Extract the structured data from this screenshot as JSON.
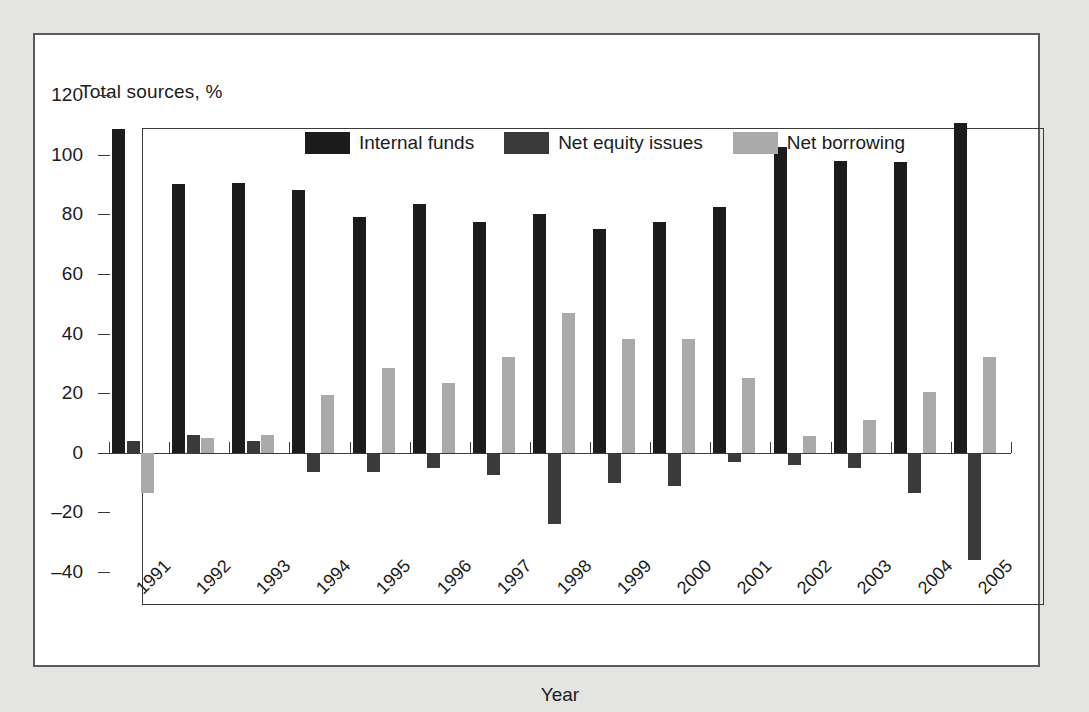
{
  "figure": {
    "y_axis_title": "Total sources, %",
    "x_axis_title": "Year"
  },
  "legend": {
    "position": "top-center",
    "items": [
      {
        "label": "Internal funds",
        "color": "#1c1c1c",
        "icon": "legend-swatch-icon"
      },
      {
        "label": "Net equity issues",
        "color": "#3a3a3a",
        "icon": "legend-swatch-icon"
      },
      {
        "label": "Net borrowing",
        "color": "#aaaaaa",
        "icon": "legend-swatch-icon"
      }
    ]
  },
  "chart_data": {
    "type": "bar",
    "title": "",
    "xlabel": "Year",
    "ylabel": "Total sources, %",
    "ylim": [
      -40,
      120
    ],
    "yticks": [
      120,
      100,
      80,
      60,
      40,
      20,
      0,
      -20,
      -40
    ],
    "ytick_labels": [
      "120",
      "100",
      "80",
      "60",
      "40",
      "20",
      "0",
      "–20",
      "–40"
    ],
    "grid": false,
    "legend_position": "top-center",
    "categories": [
      "1991",
      "1992",
      "1993",
      "1994",
      "1995",
      "1996",
      "1997",
      "1998",
      "1999",
      "2000",
      "2001",
      "2002",
      "2003",
      "2004",
      "2005"
    ],
    "series": [
      {
        "name": "Internal funds",
        "color": "#1c1c1c",
        "values": [
          108.5,
          90,
          90.5,
          88,
          79,
          83.5,
          77.5,
          80,
          75,
          77.5,
          82.5,
          102.5,
          98,
          97.5,
          110.5
        ]
      },
      {
        "name": "Net equity issues",
        "color": "#3a3a3a",
        "values": [
          4,
          6,
          4,
          -6.5,
          -6.5,
          -5,
          -7.5,
          -24,
          -10,
          -11,
          -3,
          -4,
          -5,
          -13.5,
          -36
        ]
      },
      {
        "name": "Net borrowing",
        "color": "#aaaaaa",
        "values": [
          -13.5,
          5,
          6,
          19.5,
          28.5,
          23.5,
          32,
          47,
          38,
          38,
          25,
          5.5,
          11,
          20.5,
          32
        ]
      }
    ]
  },
  "colors": {
    "page_background": "#e4e4e2",
    "figure_background": "#ffffff",
    "axis": "#3a3a3a",
    "text": "#1b1b1b"
  }
}
